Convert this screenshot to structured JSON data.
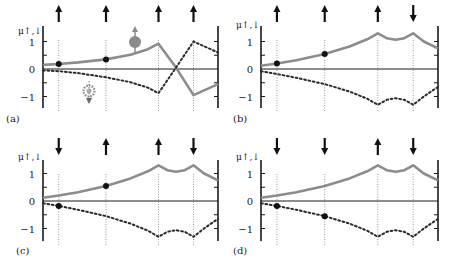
{
  "figure": {
    "y_axis_label": "μ↑,↓",
    "y_ticks": [
      {
        "value": 1,
        "label": "1"
      },
      {
        "value": 0,
        "label": "0"
      },
      {
        "value": -1,
        "label": "−1"
      }
    ],
    "minor_ticks": [
      1,
      0.5,
      -0.5,
      -1
    ],
    "colors": {
      "axis": "#1a1a1a",
      "up_curve": "#8c8c8c",
      "down_curve": "#2a2a2a",
      "site_line": "#9a9a9a",
      "arrow": "#111111",
      "marker": "#111111",
      "electron_icon": "#8a8a8a"
    },
    "legend_icons": {
      "up_electron": "spin-up-electron-icon",
      "down_electron": "spin-down-electron-icon"
    }
  },
  "chart_data": [
    {
      "type": "line",
      "panel": "(a)",
      "title": "",
      "ylabel": "μ↑,↓",
      "ylim": [
        -1.4,
        1.4
      ],
      "site_x": [
        0.09,
        0.36,
        0.66,
        0.86
      ],
      "site_spins": [
        "up",
        "up",
        "up",
        "up"
      ],
      "series": [
        {
          "name": "μ↑ (solid gray)",
          "style": "solid",
          "points": [
            [
              0,
              0.15
            ],
            [
              0.09,
              0.18
            ],
            [
              0.2,
              0.24
            ],
            [
              0.36,
              0.35
            ],
            [
              0.5,
              0.52
            ],
            [
              0.6,
              0.72
            ],
            [
              0.66,
              0.92
            ],
            [
              0.76,
              0.05
            ],
            [
              0.86,
              -0.95
            ],
            [
              1,
              -0.55
            ]
          ]
        },
        {
          "name": "μ↓ (dotted)",
          "style": "dotted",
          "points": [
            [
              0,
              -0.05
            ],
            [
              0.09,
              -0.08
            ],
            [
              0.2,
              -0.15
            ],
            [
              0.36,
              -0.3
            ],
            [
              0.5,
              -0.48
            ],
            [
              0.6,
              -0.68
            ],
            [
              0.66,
              -0.88
            ],
            [
              0.76,
              0.05
            ],
            [
              0.86,
              1.0
            ],
            [
              1,
              0.6
            ]
          ]
        }
      ],
      "markers": [
        {
          "site": 0,
          "series": 0,
          "y": 0.18
        },
        {
          "site": 1,
          "series": 0,
          "y": 0.35
        }
      ]
    },
    {
      "type": "line",
      "panel": "(b)",
      "title": "",
      "ylabel": "μ↑,↓",
      "ylim": [
        -1.4,
        1.4
      ],
      "site_x": [
        0.09,
        0.36,
        0.66,
        0.86
      ],
      "site_spins": [
        "up",
        "up",
        "up",
        "down"
      ],
      "series": [
        {
          "name": "μ↑ (solid gray)",
          "style": "solid",
          "points": [
            [
              0,
              0.12
            ],
            [
              0.09,
              0.2
            ],
            [
              0.2,
              0.32
            ],
            [
              0.36,
              0.55
            ],
            [
              0.5,
              0.82
            ],
            [
              0.6,
              1.08
            ],
            [
              0.66,
              1.3
            ],
            [
              0.71,
              1.12
            ],
            [
              0.76,
              1.06
            ],
            [
              0.81,
              1.12
            ],
            [
              0.86,
              1.3
            ],
            [
              0.92,
              1.0
            ],
            [
              1,
              0.75
            ]
          ]
        },
        {
          "name": "μ↓ (dotted)",
          "style": "dotted",
          "points": [
            [
              0,
              -0.08
            ],
            [
              0.09,
              -0.18
            ],
            [
              0.2,
              -0.32
            ],
            [
              0.36,
              -0.55
            ],
            [
              0.5,
              -0.82
            ],
            [
              0.6,
              -1.08
            ],
            [
              0.66,
              -1.3
            ],
            [
              0.71,
              -1.12
            ],
            [
              0.76,
              -1.06
            ],
            [
              0.81,
              -1.12
            ],
            [
              0.86,
              -1.3
            ],
            [
              0.92,
              -1.0
            ],
            [
              1,
              -0.65
            ]
          ]
        }
      ],
      "markers": [
        {
          "site": 0,
          "series": 0,
          "y": 0.2
        },
        {
          "site": 1,
          "series": 0,
          "y": 0.55
        }
      ]
    },
    {
      "type": "line",
      "panel": "(c)",
      "title": "",
      "ylabel": "μ↑,↓",
      "ylim": [
        -1.4,
        1.4
      ],
      "site_x": [
        0.09,
        0.36,
        0.66,
        0.86
      ],
      "site_spins": [
        "down",
        "up",
        "up",
        "down"
      ],
      "series": [
        {
          "name": "μ↑ (solid gray)",
          "style": "solid",
          "points": [
            [
              0,
              0.12
            ],
            [
              0.09,
              0.2
            ],
            [
              0.2,
              0.32
            ],
            [
              0.36,
              0.55
            ],
            [
              0.5,
              0.82
            ],
            [
              0.6,
              1.08
            ],
            [
              0.66,
              1.3
            ],
            [
              0.71,
              1.12
            ],
            [
              0.76,
              1.06
            ],
            [
              0.81,
              1.12
            ],
            [
              0.86,
              1.3
            ],
            [
              0.92,
              1.0
            ],
            [
              1,
              0.75
            ]
          ]
        },
        {
          "name": "μ↓ (dotted)",
          "style": "dotted",
          "points": [
            [
              0,
              -0.08
            ],
            [
              0.09,
              -0.18
            ],
            [
              0.2,
              -0.32
            ],
            [
              0.36,
              -0.55
            ],
            [
              0.5,
              -0.82
            ],
            [
              0.6,
              -1.08
            ],
            [
              0.66,
              -1.3
            ],
            [
              0.71,
              -1.12
            ],
            [
              0.76,
              -1.06
            ],
            [
              0.81,
              -1.12
            ],
            [
              0.86,
              -1.3
            ],
            [
              0.92,
              -1.0
            ],
            [
              1,
              -0.65
            ]
          ]
        }
      ],
      "markers": [
        {
          "site": 0,
          "series": 1,
          "y": -0.18
        },
        {
          "site": 1,
          "series": 0,
          "y": 0.55
        }
      ]
    },
    {
      "type": "line",
      "panel": "(d)",
      "title": "",
      "ylabel": "μ↑,↓",
      "ylim": [
        -1.4,
        1.4
      ],
      "site_x": [
        0.09,
        0.36,
        0.66,
        0.86
      ],
      "site_spins": [
        "down",
        "down",
        "up",
        "down"
      ],
      "series": [
        {
          "name": "μ↑ (solid gray)",
          "style": "solid",
          "points": [
            [
              0,
              0.12
            ],
            [
              0.09,
              0.2
            ],
            [
              0.2,
              0.32
            ],
            [
              0.36,
              0.55
            ],
            [
              0.5,
              0.82
            ],
            [
              0.6,
              1.08
            ],
            [
              0.66,
              1.3
            ],
            [
              0.71,
              1.12
            ],
            [
              0.76,
              1.06
            ],
            [
              0.81,
              1.12
            ],
            [
              0.86,
              1.3
            ],
            [
              0.92,
              1.0
            ],
            [
              1,
              0.75
            ]
          ]
        },
        {
          "name": "μ↓ (dotted)",
          "style": "dotted",
          "points": [
            [
              0,
              -0.08
            ],
            [
              0.09,
              -0.18
            ],
            [
              0.2,
              -0.32
            ],
            [
              0.36,
              -0.55
            ],
            [
              0.5,
              -0.82
            ],
            [
              0.6,
              -1.08
            ],
            [
              0.66,
              -1.3
            ],
            [
              0.71,
              -1.12
            ],
            [
              0.76,
              -1.06
            ],
            [
              0.81,
              -1.12
            ],
            [
              0.86,
              -1.3
            ],
            [
              0.92,
              -1.0
            ],
            [
              1,
              -0.65
            ]
          ]
        }
      ],
      "markers": [
        {
          "site": 0,
          "series": 1,
          "y": -0.18
        },
        {
          "site": 1,
          "series": 1,
          "y": -0.55
        }
      ]
    }
  ],
  "layout": {
    "panels": [
      {
        "x0": 43,
        "x1": 218,
        "y_zero": 69,
        "unit": 27.5,
        "axis_top": 26,
        "axis_bottom": 108,
        "label_x": 6,
        "label_y": 122,
        "ylabel_x": 18,
        "ylabel_y": 34,
        "arrow_y": 12
      },
      {
        "x0": 261,
        "x1": 438,
        "y_zero": 69,
        "unit": 27.5,
        "axis_top": 26,
        "axis_bottom": 108,
        "label_x": 233,
        "label_y": 122,
        "ylabel_x": 236,
        "ylabel_y": 28,
        "arrow_y": 12
      },
      {
        "x0": 43,
        "x1": 218,
        "y_zero": 201,
        "unit": 27.5,
        "axis_top": 160,
        "axis_bottom": 241,
        "label_x": 16,
        "label_y": 254,
        "ylabel_x": 18,
        "ylabel_y": 160,
        "arrow_y": 145
      },
      {
        "x0": 261,
        "x1": 438,
        "y_zero": 201,
        "unit": 27.5,
        "axis_top": 160,
        "axis_bottom": 241,
        "label_x": 233,
        "label_y": 254,
        "ylabel_x": 236,
        "ylabel_y": 160,
        "arrow_y": 145
      }
    ]
  }
}
